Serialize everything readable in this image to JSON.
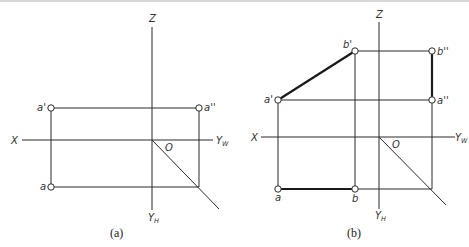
{
  "figure": {
    "panels": [
      {
        "id": "a",
        "caption": "(a)",
        "axes": {
          "z_label": "Z",
          "x_label": "X",
          "yw_label": "Y",
          "yw_sub": "W",
          "yh_label": "Y",
          "yh_sub": "H",
          "origin_label": "O"
        },
        "points": {
          "a_front": "a'",
          "a_side": "a''",
          "a_top": "a"
        }
      },
      {
        "id": "b",
        "caption": "(b)",
        "axes": {
          "z_label": "Z",
          "x_label": "X",
          "yw_label": "Y",
          "yw_sub": "W",
          "yh_label": "Y",
          "yh_sub": "H",
          "origin_label": "O"
        },
        "points": {
          "a_front": "a'",
          "b_front": "b'",
          "a_side": "a''",
          "b_side": "b''",
          "a_top": "a",
          "b_top": "b"
        }
      }
    ],
    "colors": {
      "line": "#2a2a2a",
      "background": "#ffffff"
    }
  }
}
